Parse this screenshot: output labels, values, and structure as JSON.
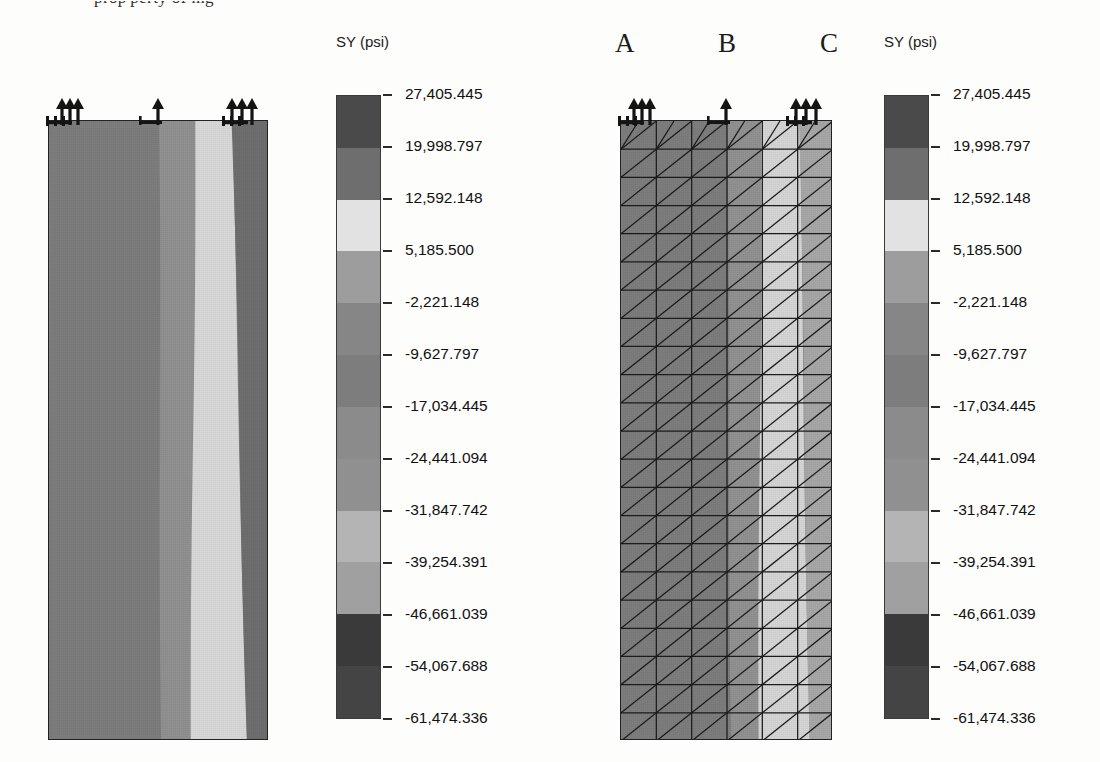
{
  "page": {
    "top_text_fragment": "prop'perty of mg"
  },
  "colorbar": {
    "title": "SY (psi)",
    "labels": [
      "27,405.445",
      "19,998.797",
      "12,592.148",
      "5,185.500",
      "-2,221.148",
      "-9,627.797",
      "-17,034.445",
      "-24,441.094",
      "-31,847.742",
      "-39,254.391",
      "-46,661.039",
      "-54,067.688",
      "-61,474.336"
    ],
    "band_colors": [
      "#4a4a4a",
      "#6e6e6e",
      "#e2e2e2",
      "#9d9d9d",
      "#868686",
      "#7d7d7d",
      "#8b8b8b",
      "#909090",
      "#b4b4b4",
      "#a0a0a0",
      "#3a3a3a",
      "#444444"
    ]
  },
  "left_model": {
    "name": "contour-plot-no-mesh",
    "bands": [
      {
        "color": "#7e7e7e",
        "x0": 0.0,
        "x1": 0.5
      },
      {
        "color": "#919191",
        "x0": 0.5,
        "x1": 0.665
      },
      {
        "color": "#d9d9d9",
        "x0": 0.665,
        "x1": 0.83
      },
      {
        "color": "#6f6f6f",
        "x0": 0.83,
        "x1": 1.0
      }
    ]
  },
  "right_model": {
    "name": "contour-plot-with-mesh",
    "column_labels": [
      "A",
      "B",
      "C"
    ],
    "mesh": {
      "cols": 6,
      "rows": 22
    },
    "bands": [
      {
        "color": "#7e7e7e",
        "x0": 0.0,
        "x1": 0.5
      },
      {
        "color": "#929292",
        "x0": 0.5,
        "x1": 0.66
      },
      {
        "color": "#d6d6d6",
        "x0": 0.66,
        "x1": 0.84
      },
      {
        "color": "#a8a8a8",
        "x0": 0.84,
        "x1": 1.0
      }
    ]
  },
  "chart_data": {
    "type": "heatmap",
    "title": "SY (psi)",
    "xlabel": "",
    "ylabel": "",
    "legend_position": "right",
    "grid": false,
    "colorbar_levels": [
      27405.445,
      19998.797,
      12592.148,
      5185.5,
      -2221.148,
      -9627.797,
      -17034.445,
      -24441.094,
      -31847.742,
      -39254.391,
      -46661.039,
      -54067.688,
      -61474.336
    ],
    "level_step": -7406.6485,
    "units": "psi",
    "panels": [
      {
        "name": "left",
        "description": "Smooth SY stress contour of a rectangular wall section, constrained and loaded along the top edge.",
        "annotations": []
      },
      {
        "name": "right",
        "description": "Same SY stress contour overlaid with the triangular finite-element mesh.",
        "annotations": [
          "A",
          "B",
          "C"
        ]
      }
    ],
    "contour_band_fractions_left": [
      0.5,
      0.165,
      0.165,
      0.17
    ],
    "contour_band_fractions_right": [
      0.5,
      0.16,
      0.18,
      0.16
    ]
  }
}
